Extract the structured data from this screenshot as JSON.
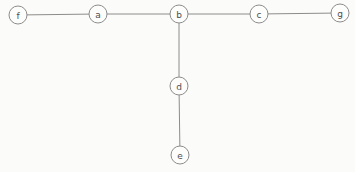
{
  "diagram": {
    "type": "graph",
    "background_color": "#fbfbf9",
    "node_fill": "#fdfdfc",
    "node_stroke": "#8c8c8c",
    "edge_color": "#8c8c8c",
    "label_color": "#4d4d4d",
    "node_radius": 9,
    "label_font_size": 9,
    "nodes": [
      {
        "id": "f",
        "label": "f",
        "x": 18,
        "y": 15
      },
      {
        "id": "a",
        "label": "a",
        "x": 98,
        "y": 14
      },
      {
        "id": "b",
        "label": "b",
        "x": 179,
        "y": 14
      },
      {
        "id": "c",
        "label": "c",
        "x": 259,
        "y": 14
      },
      {
        "id": "g",
        "label": "g",
        "x": 340,
        "y": 13
      },
      {
        "id": "d",
        "label": "d",
        "x": 179,
        "y": 86
      },
      {
        "id": "e",
        "label": "e",
        "x": 180,
        "y": 155
      }
    ],
    "edges": [
      {
        "from": "f",
        "to": "a"
      },
      {
        "from": "a",
        "to": "b"
      },
      {
        "from": "b",
        "to": "c"
      },
      {
        "from": "c",
        "to": "g"
      },
      {
        "from": "b",
        "to": "d"
      },
      {
        "from": "d",
        "to": "e"
      }
    ]
  }
}
